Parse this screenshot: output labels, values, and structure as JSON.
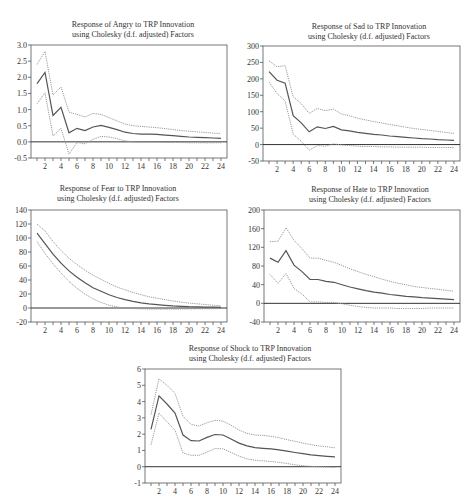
{
  "chart_data": [
    {
      "type": "line",
      "title": "Response of Angry to TRP Innovation",
      "subtitle": "using Cholesky (d.f. adjusted) Factors",
      "xlabel": "",
      "ylabel": "",
      "x": [
        1,
        2,
        3,
        4,
        5,
        6,
        7,
        8,
        9,
        10,
        11,
        12,
        13,
        14,
        15,
        16,
        17,
        18,
        19,
        20,
        21,
        22,
        23,
        24
      ],
      "xticks": [
        2,
        4,
        6,
        8,
        10,
        12,
        14,
        16,
        18,
        20,
        22,
        24
      ],
      "yticks": [
        -0.5,
        0.0,
        0.5,
        1.0,
        1.5,
        2.0,
        2.5,
        3.0
      ],
      "ytick_labels": [
        "-0.5",
        "0.0",
        "0.5",
        "1.0",
        "1.5",
        "2.0",
        "2.5",
        "3.0"
      ],
      "ylim": [
        -0.5,
        3.0
      ],
      "grid": false,
      "series": [
        {
          "name": "Upper band",
          "style": "dotted",
          "values": [
            2.4,
            2.8,
            1.45,
            1.7,
            0.92,
            0.85,
            0.77,
            0.88,
            0.85,
            0.75,
            0.65,
            0.55,
            0.5,
            0.48,
            0.46,
            0.44,
            0.41,
            0.38,
            0.35,
            0.33,
            0.31,
            0.29,
            0.27,
            0.26
          ]
        },
        {
          "name": "Response",
          "style": "solid",
          "values": [
            1.8,
            2.15,
            0.82,
            1.07,
            0.28,
            0.42,
            0.35,
            0.46,
            0.51,
            0.45,
            0.38,
            0.3,
            0.26,
            0.24,
            0.24,
            0.23,
            0.21,
            0.19,
            0.17,
            0.15,
            0.14,
            0.13,
            0.12,
            0.11
          ]
        },
        {
          "name": "Lower band",
          "style": "dotted",
          "values": [
            1.18,
            1.52,
            0.18,
            0.42,
            -0.38,
            -0.02,
            -0.06,
            0.08,
            0.17,
            0.15,
            0.1,
            0.03,
            0.0,
            -0.01,
            -0.01,
            -0.01,
            -0.02,
            -0.02,
            -0.02,
            -0.03,
            -0.03,
            -0.03,
            -0.03,
            -0.03
          ]
        }
      ]
    },
    {
      "type": "line",
      "title": "Response of Sad to TRP Innovation",
      "subtitle": "using Cholesky (d.f. adjusted) Factors",
      "xlabel": "",
      "ylabel": "",
      "x": [
        1,
        2,
        3,
        4,
        5,
        6,
        7,
        8,
        9,
        10,
        11,
        12,
        13,
        14,
        15,
        16,
        17,
        18,
        19,
        20,
        21,
        22,
        23,
        24
      ],
      "xticks": [
        2,
        4,
        6,
        8,
        10,
        12,
        14,
        16,
        18,
        20,
        22,
        24
      ],
      "yticks": [
        -50,
        0,
        50,
        100,
        150,
        200,
        250,
        300
      ],
      "ytick_labels": [
        "-50",
        "0",
        "50",
        "100",
        "150",
        "200",
        "250",
        "300"
      ],
      "ylim": [
        -50,
        300
      ],
      "grid": false,
      "series": [
        {
          "name": "Upper band",
          "style": "dotted",
          "values": [
            255,
            237,
            240,
            145,
            125,
            95,
            110,
            103,
            108,
            93,
            88,
            80,
            75,
            70,
            66,
            61,
            57,
            53,
            49,
            46,
            43,
            40,
            37,
            34
          ]
        },
        {
          "name": "Response",
          "style": "solid",
          "values": [
            222,
            196,
            187,
            88,
            66,
            39,
            54,
            49,
            55,
            45,
            42,
            37,
            34,
            31,
            29,
            26,
            24,
            22,
            20,
            18,
            17,
            15,
            14,
            13
          ]
        },
        {
          "name": "Lower band",
          "style": "dotted",
          "values": [
            190,
            155,
            133,
            32,
            10,
            -17,
            -3,
            -5,
            2,
            -1,
            -3,
            -5,
            -6,
            -6,
            -7,
            -7,
            -8,
            -8,
            -8,
            -8,
            -9,
            -9,
            -9,
            -9
          ]
        }
      ]
    },
    {
      "type": "line",
      "title": "Response of Fear to TRP Innovation",
      "subtitle": "using Cholesky (d.f. adjusted) Factors",
      "xlabel": "",
      "ylabel": "",
      "x": [
        1,
        2,
        3,
        4,
        5,
        6,
        7,
        8,
        9,
        10,
        11,
        12,
        13,
        14,
        15,
        16,
        17,
        18,
        19,
        20,
        21,
        22,
        23,
        24
      ],
      "xticks": [
        2,
        4,
        6,
        8,
        10,
        12,
        14,
        16,
        18,
        20,
        22,
        24
      ],
      "yticks": [
        -20,
        0,
        20,
        40,
        60,
        80,
        100,
        120,
        140
      ],
      "ytick_labels": [
        "-20",
        "0",
        "20",
        "40",
        "60",
        "80",
        "100",
        "120",
        "140"
      ],
      "ylim": [
        -20,
        140
      ],
      "grid": false,
      "series": [
        {
          "name": "Upper band",
          "style": "dotted",
          "values": [
            120,
            110,
            95,
            82,
            71,
            62,
            54,
            47,
            41,
            35,
            30,
            26,
            22,
            19,
            16,
            14,
            12,
            10,
            8.5,
            7,
            6,
            5,
            4,
            3.5
          ]
        },
        {
          "name": "Response",
          "style": "solid",
          "values": [
            107,
            92,
            77,
            64,
            53,
            44,
            36,
            29,
            24,
            19,
            15,
            12,
            9.5,
            7.5,
            6,
            4.8,
            3.8,
            3,
            2.4,
            1.9,
            1.6,
            1.3,
            1.1,
            0.9
          ]
        },
        {
          "name": "Lower band",
          "style": "dotted",
          "values": [
            95,
            78,
            63,
            50,
            38,
            28,
            20,
            13,
            8,
            4,
            1.5,
            0,
            -0.8,
            -1.2,
            -1.4,
            -1.5,
            -1.5,
            -1.5,
            -1.4,
            -1.3,
            -1.2,
            -1.1,
            -1.0,
            -0.9
          ]
        }
      ]
    },
    {
      "type": "line",
      "title": "Response of Hate to TRP Innovation",
      "subtitle": "using Cholesky (d.f. adjusted) Factors",
      "xlabel": "",
      "ylabel": "",
      "x": [
        1,
        2,
        3,
        4,
        5,
        6,
        7,
        8,
        9,
        10,
        11,
        12,
        13,
        14,
        15,
        16,
        17,
        18,
        19,
        20,
        21,
        22,
        23,
        24
      ],
      "xticks": [
        2,
        4,
        6,
        8,
        10,
        12,
        14,
        16,
        18,
        20,
        22,
        24
      ],
      "yticks": [
        -40,
        0,
        40,
        80,
        120,
        160,
        200
      ],
      "ytick_labels": [
        "-40",
        "0",
        "40",
        "80",
        "120",
        "160",
        "200"
      ],
      "ylim": [
        -40,
        200
      ],
      "grid": false,
      "series": [
        {
          "name": "Upper band",
          "style": "dotted",
          "values": [
            132,
            133,
            162,
            135,
            117,
            97,
            97,
            92,
            88,
            81,
            74,
            68,
            62,
            57,
            52,
            47,
            43,
            40,
            36,
            34,
            32,
            30,
            28,
            26
          ]
        },
        {
          "name": "Response",
          "style": "solid",
          "values": [
            97,
            88,
            113,
            82,
            68,
            51,
            51,
            47,
            45,
            40,
            35,
            31,
            27,
            24,
            22,
            19,
            17,
            15,
            14,
            12,
            11,
            10,
            9,
            8
          ]
        },
        {
          "name": "Lower band",
          "style": "dotted",
          "values": [
            62,
            43,
            64,
            32,
            20,
            3,
            3,
            2,
            2,
            -1,
            -4,
            -7,
            -9,
            -10,
            -10,
            -10,
            -11,
            -11,
            -11,
            -11,
            -10,
            -10,
            -10,
            -10
          ]
        }
      ]
    },
    {
      "type": "line",
      "title": "Response of Shock to TRP Innovation",
      "subtitle": "using Cholesky (d.f. adjusted) Factors",
      "xlabel": "",
      "ylabel": "",
      "x": [
        1,
        2,
        3,
        4,
        5,
        6,
        7,
        8,
        9,
        10,
        11,
        12,
        13,
        14,
        15,
        16,
        17,
        18,
        19,
        20,
        21,
        22,
        23,
        24
      ],
      "xticks": [
        2,
        4,
        6,
        8,
        10,
        12,
        14,
        16,
        18,
        20,
        22,
        24
      ],
      "yticks": [
        -1,
        0,
        1,
        2,
        3,
        4,
        5,
        6
      ],
      "ytick_labels": [
        "-1",
        "0",
        "1",
        "2",
        "3",
        "4",
        "5",
        "6"
      ],
      "ylim": [
        -1,
        6
      ],
      "grid": false,
      "series": [
        {
          "name": "Upper band",
          "style": "dotted",
          "values": [
            3.2,
            5.4,
            5.0,
            4.5,
            3.1,
            2.6,
            2.5,
            2.7,
            2.85,
            2.8,
            2.55,
            2.25,
            2.05,
            1.95,
            1.92,
            1.87,
            1.78,
            1.66,
            1.56,
            1.45,
            1.35,
            1.28,
            1.22,
            1.16
          ]
        },
        {
          "name": "Response",
          "style": "solid",
          "values": [
            2.3,
            4.35,
            3.85,
            3.3,
            1.95,
            1.6,
            1.58,
            1.8,
            1.98,
            1.95,
            1.7,
            1.45,
            1.28,
            1.17,
            1.13,
            1.1,
            1.03,
            0.95,
            0.87,
            0.8,
            0.73,
            0.68,
            0.64,
            0.6
          ]
        },
        {
          "name": "Lower band",
          "style": "dotted",
          "values": [
            1.35,
            3.3,
            2.75,
            2.25,
            0.85,
            0.7,
            0.7,
            0.9,
            1.12,
            1.1,
            0.88,
            0.65,
            0.48,
            0.4,
            0.36,
            0.32,
            0.27,
            0.2,
            0.12,
            0.06,
            0.02,
            0.0,
            -0.02,
            -0.04
          ]
        }
      ]
    }
  ],
  "layout": [
    {
      "frame": {
        "left": 31,
        "top": 45,
        "right": 227,
        "bottom": 158
      },
      "title_center": 133,
      "title_top": 20
    },
    {
      "frame": {
        "left": 263,
        "top": 46,
        "right": 460,
        "bottom": 161
      },
      "title_center": 369,
      "title_top": 22
    },
    {
      "frame": {
        "left": 31,
        "top": 210,
        "right": 227,
        "bottom": 322
      },
      "title_center": 118,
      "title_top": 184
    },
    {
      "frame": {
        "left": 264,
        "top": 210,
        "right": 460,
        "bottom": 322
      },
      "title_center": 370,
      "title_top": 185
    },
    {
      "frame": {
        "left": 145,
        "top": 369,
        "right": 341,
        "bottom": 483
      },
      "title_center": 250,
      "title_top": 344
    }
  ],
  "colors": {
    "frame": "#555555",
    "solid": "#555555",
    "dotted": "#999999",
    "zero": "#333333"
  }
}
